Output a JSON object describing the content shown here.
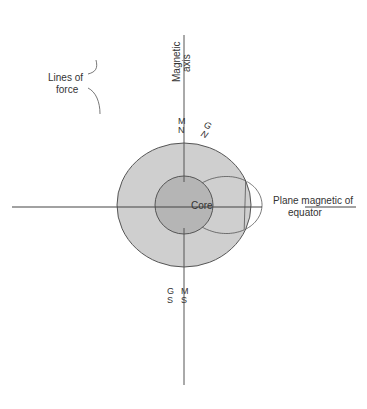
{
  "labels": {
    "magnetic_axis_line1": "Magnetic",
    "magnetic_axis_line2": "axis",
    "lines_of_force_line1": "Lines of",
    "lines_of_force_line2": "force",
    "core": "Core",
    "equator_line1": "Plane magnetic of",
    "equator_line2": "equator",
    "magnetic_north_M": "M",
    "magnetic_north_N": "N",
    "geographic_north_G": "G",
    "geographic_north_N": "N",
    "magnetic_south_M": "M",
    "magnetic_south_S": "S",
    "geographic_south_G": "G",
    "geographic_south_S": "S"
  },
  "colors": {
    "earth_fill": "#cfcfcf",
    "core_fill": "#b5b5b5",
    "line": "#555555",
    "arrow": "#111111"
  }
}
